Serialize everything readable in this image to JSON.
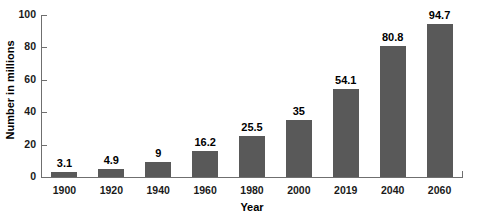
{
  "chart_data": {
    "type": "bar",
    "title": "",
    "subtitle": "",
    "xlabel": "Year",
    "ylabel": "Number in millions",
    "categories": [
      "1900",
      "1920",
      "1940",
      "1960",
      "1980",
      "2000",
      "2019",
      "2040",
      "2060"
    ],
    "values": [
      3.1,
      4.9,
      9,
      16.2,
      25.5,
      35,
      54.1,
      80.8,
      94.7
    ],
    "value_labels": [
      "3.1",
      "4.9",
      "9",
      "16.2",
      "25.5",
      "35",
      "54.1",
      "80.8",
      "94.7"
    ],
    "ylim": [
      0,
      100
    ],
    "ytick_labels": [
      "0",
      "20",
      "40",
      "60",
      "80",
      "100"
    ],
    "ytick_values": [
      0,
      20,
      40,
      60,
      80,
      100
    ],
    "grid": false,
    "legend": null,
    "legend_position": "none",
    "series": [
      {
        "name": "Number in millions",
        "values": [
          3.1,
          4.9,
          9,
          16.2,
          25.5,
          35,
          54.1,
          80.8,
          94.7
        ]
      }
    ],
    "colors": {
      "bar_fill": "#595959",
      "axis_line": "#6f6f6f",
      "text": "#000000",
      "background": "#ffffff"
    }
  }
}
